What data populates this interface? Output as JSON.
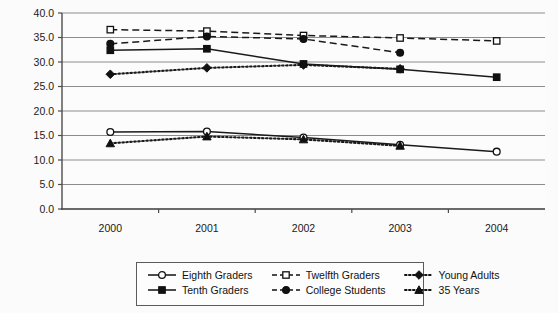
{
  "chart_data": {
    "type": "line",
    "title": "",
    "xlabel": "",
    "ylabel": "",
    "x": [
      "2000",
      "2001",
      "2002",
      "2003",
      "2004"
    ],
    "categories": [
      "2000",
      "2001",
      "2002",
      "2003",
      "2004"
    ],
    "ylim": [
      0.0,
      40.0
    ],
    "yticks": [
      "0.0",
      "5.0",
      "10.0",
      "15.0",
      "20.0",
      "25.0",
      "30.0",
      "35.0",
      "40.0"
    ],
    "ytick_values": [
      0.0,
      5.0,
      10.0,
      15.0,
      20.0,
      25.0,
      30.0,
      35.0,
      40.0
    ],
    "grid": true,
    "legend_position": "bottom",
    "series": [
      {
        "name": "Eighth Graders",
        "marker": "open-circle",
        "line": "solid",
        "values": [
          15.7,
          15.8,
          14.6,
          13.1,
          11.7
        ]
      },
      {
        "name": "Tenth Graders",
        "marker": "filled-square",
        "line": "solid",
        "values": [
          32.4,
          32.7,
          29.6,
          28.5,
          26.9
        ]
      },
      {
        "name": "Twelfth Graders",
        "marker": "open-square",
        "line": "dashed",
        "values": [
          36.6,
          36.3,
          35.4,
          34.9,
          34.3
        ]
      },
      {
        "name": "College Students",
        "marker": "filled-circle",
        "line": "dashed",
        "values": [
          33.7,
          35.2,
          34.7,
          31.9,
          null
        ]
      },
      {
        "name": "Young Adults",
        "marker": "filled-diamond",
        "line": "dotted",
        "values": [
          27.5,
          28.8,
          29.4,
          28.6,
          null
        ]
      },
      {
        "name": "35 Years",
        "marker": "filled-triangle",
        "line": "dotted",
        "values": [
          13.4,
          14.8,
          14.2,
          12.9,
          null
        ]
      }
    ]
  },
  "legend": {
    "entries": [
      {
        "label": "Eighth Graders",
        "marker": "open-circle",
        "line": "solid"
      },
      {
        "label": "Twelfth Graders",
        "marker": "open-square",
        "line": "dashed"
      },
      {
        "label": "Young Adults",
        "marker": "filled-diamond",
        "line": "dotted"
      },
      {
        "label": "Tenth Graders",
        "marker": "filled-square",
        "line": "solid"
      },
      {
        "label": "College Students",
        "marker": "filled-circle",
        "line": "dashed"
      },
      {
        "label": "35 Years",
        "marker": "filled-triangle",
        "line": "dotted"
      }
    ]
  },
  "colors": {
    "line": "#1a1a1a",
    "grid": "#8c8c8c",
    "axis": "#4d4d4d",
    "background": "#fbfbfb",
    "text": "#111111"
  }
}
